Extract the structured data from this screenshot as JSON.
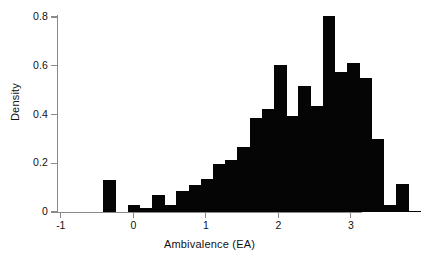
{
  "chart_data": {
    "type": "bar",
    "subtype": "histogram",
    "title": "",
    "xlabel": "Ambivalence (EA)",
    "ylabel": "Density",
    "xlim": [
      -1.12,
      3.12
    ],
    "ylim": [
      0,
      0.84
    ],
    "xticks": [
      "-1",
      "0",
      "1",
      "2",
      "3"
    ],
    "xtick_values": [
      -1,
      0,
      1,
      2,
      3
    ],
    "yticks": [
      "0",
      "0.2",
      "0.4",
      "0.6",
      "0.8"
    ],
    "ytick_values": [
      0,
      0.2,
      0.4,
      0.6,
      0.8
    ],
    "grid": false,
    "legend": null,
    "bin_width": 0.167,
    "bar_color": "#050505",
    "axis_color": "#8a8a8a",
    "bins": [
      {
        "x0": -0.42,
        "x1": -0.25,
        "value": 0.131
      },
      {
        "x0": -0.25,
        "x1": -0.08,
        "value": 0.0
      },
      {
        "x0": -0.08,
        "x1": 0.04,
        "value": 0.027
      },
      {
        "x0": 0.04,
        "x1": 0.21,
        "value": 0.017
      },
      {
        "x0": 0.21,
        "x1": 0.38,
        "value": 0.07
      },
      {
        "x0": 0.38,
        "x1": 0.54,
        "value": 0.03
      },
      {
        "x0": 0.54,
        "x1": 0.71,
        "value": 0.088
      },
      {
        "x0": 0.71,
        "x1": 0.88,
        "value": 0.111
      },
      {
        "x0": 0.88,
        "x1": 1.04,
        "value": 0.134
      },
      {
        "x0": 1.04,
        "x1": 1.21,
        "value": 0.196
      },
      {
        "x0": 1.21,
        "x1": 1.38,
        "value": 0.214
      },
      {
        "x0": 1.38,
        "x1": 1.54,
        "value": 0.266
      },
      {
        "x0": 1.54,
        "x1": 1.71,
        "value": 0.385
      },
      {
        "x0": 1.71,
        "x1": 1.88,
        "value": 0.422
      },
      {
        "x0": 1.88,
        "x1": 2.04,
        "value": 0.603
      },
      {
        "x0": 2.04,
        "x1": 2.21,
        "value": 0.393
      },
      {
        "x0": 2.21,
        "x1": 2.38,
        "value": 0.518
      },
      {
        "x0": 2.38,
        "x1": 2.54,
        "value": 0.434
      },
      {
        "x0": 2.54,
        "x1": 2.71,
        "value": 0.803
      },
      {
        "x0": 2.71,
        "x1": 2.88,
        "value": 0.573
      },
      {
        "x0": 2.88,
        "x1": 3.04,
        "value": 0.611
      },
      {
        "x0": 3.04,
        "x1": 3.21,
        "value": 0.551
      },
      {
        "x0": 3.21,
        "x1": 3.38,
        "value": 0.298
      },
      {
        "x0": 3.38,
        "x1": 3.54,
        "value": 0.03
      },
      {
        "x0": 3.54,
        "x1": 3.71,
        "value": 0.113
      },
      {
        "x0": 3.71,
        "x1": 3.88,
        "value": 0.006
      }
    ]
  },
  "axes": {
    "x_title": "Ambivalence (EA)",
    "y_title": "Density",
    "x_ticks": [
      {
        "label": "-1",
        "value": -1
      },
      {
        "label": "0",
        "value": 0
      },
      {
        "label": "1",
        "value": 1
      },
      {
        "label": "2",
        "value": 2
      },
      {
        "label": "3",
        "value": 3
      }
    ],
    "y_ticks": [
      {
        "label": "0",
        "value": 0
      },
      {
        "label": "0.2",
        "value": 0.2
      },
      {
        "label": "0.4",
        "value": 0.4
      },
      {
        "label": "0.6",
        "value": 0.6
      },
      {
        "label": "0.8",
        "value": 0.8
      }
    ]
  }
}
